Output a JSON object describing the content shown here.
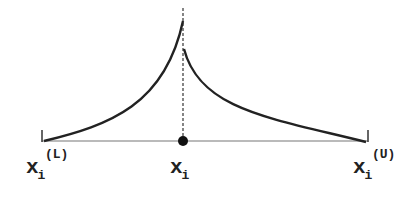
{
  "diagram": {
    "type": "asymmetric-peaked-distribution",
    "labels": {
      "lower_bound": {
        "base": "x",
        "sub": "i",
        "sup": "(L)"
      },
      "center": {
        "base": "x",
        "sub": "i"
      },
      "upper_bound": {
        "base": "x",
        "sub": "i",
        "sup": "(U)"
      }
    },
    "colors": {
      "line": "#222222",
      "axis": "#555555",
      "background": "#ffffff"
    }
  }
}
